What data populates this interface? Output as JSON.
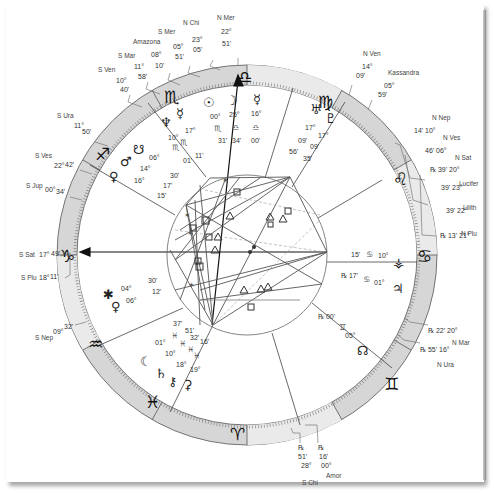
{
  "chart": {
    "type": "natal-wheel",
    "center": [
      247,
      255
    ],
    "zodiac_signs": [
      {
        "name": "Capricorn",
        "glyph": "♑",
        "angle": 180
      },
      {
        "name": "Sagittarius",
        "glyph": "♐",
        "angle": 150
      },
      {
        "name": "Scorpio",
        "glyph": "♏",
        "angle": 120
      },
      {
        "name": "Libra",
        "glyph": "♎",
        "angle": 90
      },
      {
        "name": "Virgo",
        "glyph": "♍",
        "angle": 60
      },
      {
        "name": "Leo",
        "glyph": "♌",
        "angle": 30
      },
      {
        "name": "Cancer",
        "glyph": "♋",
        "angle": 0
      },
      {
        "name": "Gemini",
        "glyph": "♊",
        "angle": -30
      },
      {
        "name": "Taurus",
        "glyph": "♉",
        "angle": -60
      },
      {
        "name": "Aries",
        "glyph": "♈",
        "angle": -90
      },
      {
        "name": "Pisces",
        "glyph": "♓",
        "angle": -120
      },
      {
        "name": "Aquarius",
        "glyph": "♒",
        "angle": -150
      }
    ],
    "angles": {
      "ascendant_label": "ASC",
      "mc_label": "MC"
    }
  },
  "outer_labels": {
    "top": [
      {
        "name": "N Chi",
        "deg": "23°",
        "min": "05'"
      },
      {
        "name": "N Mer",
        "deg": "22°",
        "min": "51'"
      },
      {
        "name": "S Mer",
        "deg": "05°",
        "min": "51'"
      },
      {
        "name": "Amazona",
        "deg": "08°",
        "min": "10'"
      },
      {
        "name": "S Mar",
        "deg": "11°",
        "min": "58'"
      },
      {
        "name": "S Ven",
        "deg": "10°",
        "min": "40'"
      }
    ],
    "top_right": [
      {
        "name": "N Ven",
        "deg": "14°",
        "min": "09'"
      },
      {
        "name": "Kassandra",
        "deg": "05°",
        "min": "59'"
      }
    ],
    "right": [
      {
        "name": "N Nep",
        "text": "14' 10°"
      },
      {
        "name": "N Ves",
        "text": "46' 06°"
      },
      {
        "name": "N Sat",
        "text": "℞ 39' 20°"
      },
      {
        "name": "Lucifer",
        "text": "39' 23°"
      },
      {
        "name": "Lilith",
        "text": "39' 22°"
      },
      {
        "name": "N Plu",
        "text": "℞ 13' 21°"
      },
      {
        "name": "N Mar",
        "text": "℞ 22' 20°"
      },
      {
        "name": "N Ura",
        "text": "℞ 55' 16°"
      }
    ],
    "left": [
      {
        "name": "S Ura",
        "deg": "11°",
        "min": "50'"
      },
      {
        "name": "S Ves",
        "deg": "22°",
        "min": "42'"
      },
      {
        "name": "S Jup",
        "deg": "00°",
        "min": "34'"
      },
      {
        "name": "S Sat",
        "deg": "17°",
        "min": "49'"
      },
      {
        "name": "S Plu",
        "deg": "18°",
        "min": "11'"
      },
      {
        "name": "S Nep",
        "deg": "09°",
        "min": "32'"
      }
    ],
    "bottom": [
      {
        "name": "S Chi",
        "deg": "28°",
        "min": "51'"
      },
      {
        "name": "Amor",
        "deg": "00°",
        "min": "16'"
      }
    ]
  },
  "planets": {
    "top_house": [
      {
        "name": "Sun",
        "glyph": "☉",
        "deg": "00°",
        "sign": "♏",
        "min": "31'"
      },
      {
        "name": "Moon",
        "glyph": "☽",
        "deg": "25°",
        "sign": "♎",
        "min": "34'"
      },
      {
        "name": "Mercury",
        "glyph": "☿",
        "deg": "16°",
        "sign": "♎",
        "min": "00'"
      }
    ],
    "scorpio_house": [
      {
        "name": "Neptune",
        "glyph": "♆",
        "deg": "17°",
        "sign": "♏",
        "min": "11'"
      },
      {
        "name": "Mercury2",
        "glyph": "☿",
        "deg": "10°",
        "sign": "♏",
        "min": "01'"
      }
    ],
    "virgo_house": [
      {
        "name": "Uranus",
        "glyph": "♅",
        "deg": "17°",
        "sign": "♍",
        "min": "56'"
      },
      {
        "name": "Pluto",
        "glyph": "♇",
        "deg": "17°",
        "sign": "♍",
        "min": "35'"
      }
    ],
    "sagittarius_house": [
      {
        "name": "Node",
        "glyph": "☋",
        "deg": "06°",
        "min": "30'"
      },
      {
        "name": "Mars",
        "glyph": "♂",
        "deg": "14°",
        "min": "17'"
      },
      {
        "name": "Venus",
        "glyph": "♀",
        "deg": "16°",
        "min": "15'"
      }
    ],
    "aquarius_house": [
      {
        "name": "Ceres",
        "glyph": "✱",
        "deg": "04°",
        "min": "30'"
      },
      {
        "name": "Venus2",
        "glyph": "♀",
        "deg": "06°",
        "min": "12'"
      }
    ],
    "pisces_house": [
      {
        "deg": "01°",
        "min": "37'"
      },
      {
        "deg": "10°",
        "min": "51'"
      },
      {
        "deg": "18°",
        "min": "32'"
      },
      {
        "deg": "19°",
        "min": "16'"
      }
    ],
    "pisces_glyphs": [
      "☾",
      "♄",
      "⚷",
      "⚳"
    ],
    "cancer_house": [
      {
        "name": "Vesta",
        "glyph": "⚶",
        "deg": "10°",
        "min": "15'"
      },
      {
        "name": "Jupiter",
        "glyph": "♃",
        "deg": "01°",
        "min": "17'"
      }
    ],
    "gemini_house": [
      {
        "name": "North Node",
        "glyph": "☊",
        "deg": "05°",
        "min": "00'"
      }
    ]
  }
}
